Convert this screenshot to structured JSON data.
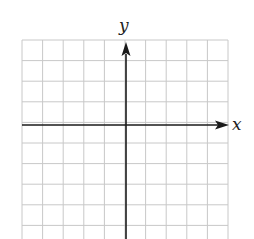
{
  "diagram": {
    "type": "coordinate-grid",
    "x_axis_label": "x",
    "y_axis_label": "y",
    "grid": {
      "left": 22,
      "top": 40,
      "cell": 20.6,
      "cols": 10,
      "rows": 10
    },
    "origin": {
      "x": 126,
      "y": 125
    },
    "colors": {
      "grid": "#c8c8c8",
      "axis": "#1a1a1a",
      "background": "#ffffff"
    }
  }
}
